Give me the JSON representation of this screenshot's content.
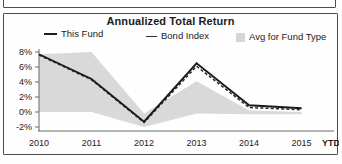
{
  "panel": {
    "title": "Annualized Total Return"
  },
  "legend": {
    "items": [
      {
        "label": "This Fund",
        "swatch": "solid-line-swatch"
      },
      {
        "label": "Bond Index",
        "swatch": "thin-line-swatch"
      },
      {
        "label": "Avg for Fund Type",
        "swatch": "gray-square-swatch"
      }
    ]
  },
  "axes": {
    "y_ticks": [
      "8%",
      "6%",
      "4%",
      "2%",
      "0%",
      "-2%"
    ],
    "x_ticks": [
      "2010",
      "2011",
      "2012",
      "2013",
      "2014",
      "2015"
    ],
    "x_extra_label": "YTD"
  },
  "chart_data": {
    "type": "line",
    "title": "Annualized Total Return",
    "xlabel": "",
    "ylabel": "",
    "x": [
      "2010",
      "2011",
      "2012",
      "2013",
      "2014",
      "2015"
    ],
    "x_extra_label": "YTD",
    "ylim": [
      -2,
      8
    ],
    "ytick_values": [
      8,
      6,
      4,
      2,
      0,
      -2
    ],
    "ytick_labels": [
      "8%",
      "6%",
      "4%",
      "2%",
      "0%",
      "-2%"
    ],
    "grid": false,
    "legend_position": "top",
    "series": [
      {
        "name": "This Fund",
        "style": "solid",
        "color": "#1a1a1a",
        "values": [
          7.7,
          4.4,
          -1.3,
          6.5,
          0.9,
          0.5
        ]
      },
      {
        "name": "Bond Index",
        "style": "dashed",
        "color": "#2b2b2b",
        "values": [
          7.6,
          4.3,
          -1.4,
          6.1,
          0.6,
          0.3
        ]
      },
      {
        "name": "Avg for Fund Type",
        "style": "area",
        "color": "#d9d9d9",
        "upper_values": [
          7.7,
          8.0,
          -0.2,
          4.1,
          0.2,
          0.0
        ],
        "lower_values": [
          0.0,
          0.0,
          -2.0,
          -0.2,
          -0.3,
          -0.3
        ]
      }
    ]
  }
}
